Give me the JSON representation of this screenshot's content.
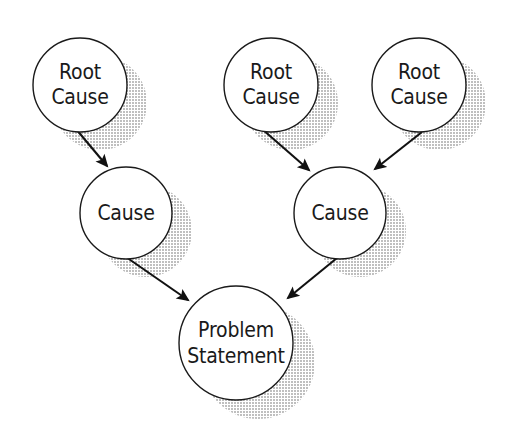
{
  "diagram": {
    "type": "root-cause-analysis",
    "canvas": {
      "width": 509,
      "height": 436,
      "background": "#ffffff"
    },
    "style": {
      "node_fill": "#ffffff",
      "node_stroke": "#1a1a1a",
      "node_stroke_width": 1.4,
      "shadow_color": "#c9c9c9",
      "shadow_offset_x": 20,
      "shadow_offset_y": 18,
      "arrow_color": "#111111",
      "text_color": "#1a1a1a"
    },
    "nodes": [
      {
        "id": "root-cause-1",
        "name": "root-cause-left",
        "lines": [
          "Root",
          "Cause"
        ],
        "cx": 80,
        "cy": 85,
        "r": 47
      },
      {
        "id": "root-cause-2",
        "name": "root-cause-middle",
        "lines": [
          "Root",
          "Cause"
        ],
        "cx": 271,
        "cy": 85,
        "r": 47
      },
      {
        "id": "root-cause-3",
        "name": "root-cause-right",
        "lines": [
          "Root",
          "Cause"
        ],
        "cx": 419,
        "cy": 85,
        "r": 47
      },
      {
        "id": "cause-1",
        "name": "cause-left",
        "lines": [
          "Cause"
        ],
        "cx": 126,
        "cy": 213,
        "r": 46
      },
      {
        "id": "cause-2",
        "name": "cause-right",
        "lines": [
          "Cause"
        ],
        "cx": 340,
        "cy": 213,
        "r": 46
      },
      {
        "id": "problem-statement",
        "name": "problem-statement",
        "lines": [
          "Problem",
          "Statement"
        ],
        "cx": 236,
        "cy": 343,
        "r": 57
      }
    ],
    "edges": [
      {
        "id": "edge-1",
        "name": "arrow-root1-to-cause1",
        "from": "root-cause-1",
        "to": "cause-1",
        "x1": 76,
        "y1": 129,
        "x2": 107,
        "y2": 166
      },
      {
        "id": "edge-2",
        "name": "arrow-root2-to-cause2",
        "from": "root-cause-2",
        "to": "cause-2",
        "x1": 262,
        "y1": 129,
        "x2": 309,
        "y2": 170
      },
      {
        "id": "edge-3",
        "name": "arrow-root3-to-cause2",
        "from": "root-cause-3",
        "to": "cause-2",
        "x1": 422,
        "y1": 132,
        "x2": 375,
        "y2": 169
      },
      {
        "id": "edge-4",
        "name": "arrow-cause1-to-problem",
        "from": "cause-1",
        "to": "problem-statement",
        "x1": 126,
        "y1": 257,
        "x2": 188,
        "y2": 300
      },
      {
        "id": "edge-5",
        "name": "arrow-cause2-to-problem",
        "from": "cause-2",
        "to": "problem-statement",
        "x1": 337,
        "y1": 258,
        "x2": 288,
        "y2": 298
      }
    ]
  }
}
